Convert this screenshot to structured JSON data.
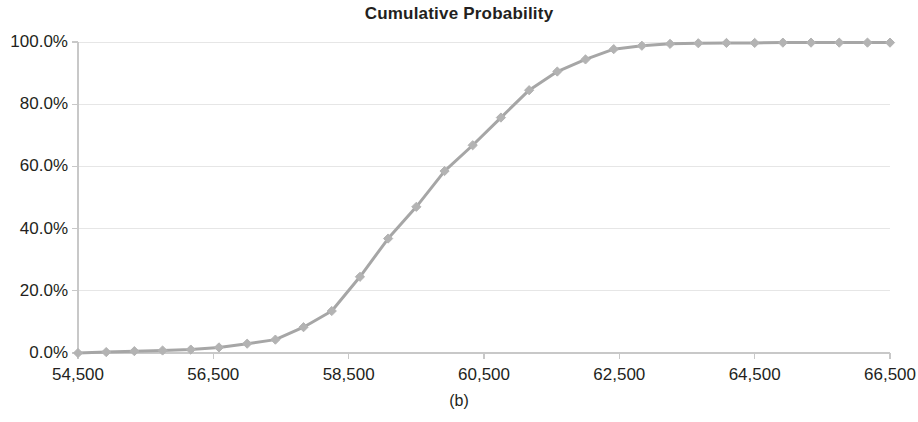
{
  "chart_data": {
    "type": "line",
    "title": "Cumulative Probability",
    "caption": "(b)",
    "xlabel": "",
    "ylabel": "",
    "xlim": [
      54500,
      66500
    ],
    "ylim": [
      0,
      1
    ],
    "grid": true,
    "legend": null,
    "x_tick_labels": [
      "54,500",
      "56,500",
      "58,500",
      "60,500",
      "62,500",
      "64,500",
      "66,500"
    ],
    "x_ticks": [
      54500,
      56500,
      58500,
      60500,
      62500,
      64500,
      66500
    ],
    "y_tick_labels": [
      "0.0%",
      "20.0%",
      "40.0%",
      "60.0%",
      "80.0%",
      "100.0%"
    ],
    "y_ticks": [
      0,
      0.2,
      0.4,
      0.6,
      0.8,
      1.0
    ],
    "series": [
      {
        "name": "Cumulative Probability",
        "color": "#a6a6a6",
        "marker": "diamond",
        "x": [
          54500,
          54917,
          55333,
          55750,
          56167,
          56583,
          57000,
          57417,
          57833,
          58250,
          58667,
          59083,
          59500,
          59917,
          60333,
          60750,
          61167,
          61583,
          62000,
          62417,
          62833,
          63250,
          63667,
          64083,
          64500,
          64917,
          65333,
          65750,
          66167,
          66500
        ],
        "values": [
          0.0,
          0.003,
          0.006,
          0.008,
          0.011,
          0.018,
          0.03,
          0.043,
          0.083,
          0.135,
          0.245,
          0.368,
          0.47,
          0.585,
          0.668,
          0.757,
          0.845,
          0.905,
          0.944,
          0.977,
          0.988,
          0.994,
          0.996,
          0.997,
          0.997,
          0.998,
          0.998,
          0.998,
          0.998,
          0.998
        ]
      }
    ]
  },
  "colors": {
    "line": "#a6a6a6",
    "marker": "#b3b3b3",
    "grid": "#e6e6e6",
    "axis": "#c8c8c8",
    "text": "#231f20",
    "background": "#ffffff"
  },
  "title": "Cumulative Probability",
  "caption": "(b)"
}
